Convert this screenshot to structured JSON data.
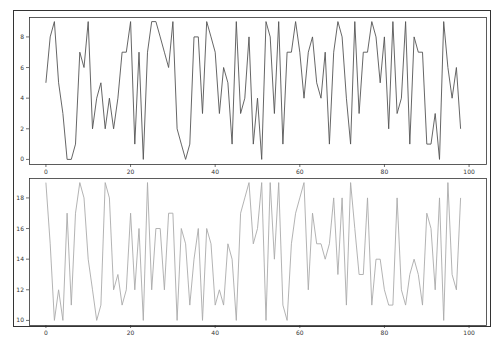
{
  "figure": {
    "outer_frame": {
      "x": 13,
      "y": 10,
      "w": 477,
      "h": 316
    },
    "background": "#ffffff",
    "frame_color": "#333333"
  },
  "chart_data": [
    {
      "type": "line",
      "title": "",
      "xlabel": "",
      "ylabel": "",
      "color": "#555555",
      "xlim": [
        -4,
        104
      ],
      "ylim": [
        -0.3,
        9.3
      ],
      "xticks": [
        0,
        20,
        40,
        60,
        80,
        100
      ],
      "yticks": [
        0,
        2,
        4,
        6,
        8
      ],
      "grid": false,
      "legend": null,
      "x": [
        0,
        1,
        2,
        3,
        4,
        5,
        6,
        7,
        8,
        9,
        10,
        11,
        12,
        13,
        14,
        15,
        16,
        17,
        18,
        19,
        20,
        21,
        22,
        23,
        24,
        25,
        26,
        27,
        28,
        29,
        30,
        31,
        32,
        33,
        34,
        35,
        36,
        37,
        38,
        39,
        40,
        41,
        42,
        43,
        44,
        45,
        46,
        47,
        48,
        49,
        50,
        51,
        52,
        53,
        54,
        55,
        56,
        57,
        58,
        59,
        60,
        61,
        62,
        63,
        64,
        65,
        66,
        67,
        68,
        69,
        70,
        71,
        72,
        73,
        74,
        75,
        76,
        77,
        78,
        79,
        80,
        81,
        82,
        83,
        84,
        85,
        86,
        87,
        88,
        89,
        90,
        91,
        92,
        93,
        94,
        95,
        96,
        97,
        98
      ],
      "values": [
        5,
        8,
        9,
        5,
        3,
        0,
        0,
        1,
        7,
        6,
        9,
        2,
        4,
        5,
        2,
        4,
        2,
        4,
        7,
        7,
        9,
        1,
        7,
        0,
        7,
        9,
        9,
        8,
        7,
        6,
        9,
        2,
        1,
        0,
        1,
        8,
        8,
        3,
        9,
        8,
        7,
        3,
        6,
        5,
        1,
        9,
        3,
        4,
        8,
        1,
        4,
        0,
        9,
        8,
        3,
        9,
        1,
        7,
        7,
        9,
        7,
        4,
        7,
        8,
        5,
        4,
        7,
        1,
        7,
        9,
        8,
        4,
        1,
        9,
        3,
        7,
        7,
        9,
        8,
        5,
        8,
        2,
        9,
        3,
        4,
        9,
        1,
        8,
        7,
        7,
        1,
        1,
        3,
        0,
        9,
        6,
        4,
        6,
        2,
        5,
        7,
        8,
        4,
        4,
        7,
        7,
        4
      ],
      "series": [
        {
          "name": "series_top",
          "note": "99 integer points in range 0-9"
        }
      ]
    },
    {
      "type": "line",
      "title": "",
      "xlabel": "",
      "ylabel": "",
      "color": "#aaaaaa",
      "xlim": [
        -4,
        104
      ],
      "ylim": [
        9.7,
        19.3
      ],
      "xticks": [
        0,
        20,
        40,
        60,
        80,
        100
      ],
      "yticks": [
        10,
        12,
        14,
        16,
        18
      ],
      "grid": false,
      "legend": null,
      "x": [
        0,
        1,
        2,
        3,
        4,
        5,
        6,
        7,
        8,
        9,
        10,
        11,
        12,
        13,
        14,
        15,
        16,
        17,
        18,
        19,
        20,
        21,
        22,
        23,
        24,
        25,
        26,
        27,
        28,
        29,
        30,
        31,
        32,
        33,
        34,
        35,
        36,
        37,
        38,
        39,
        40,
        41,
        42,
        43,
        44,
        45,
        46,
        47,
        48,
        49,
        50,
        51,
        52,
        53,
        54,
        55,
        56,
        57,
        58,
        59,
        60,
        61,
        62,
        63,
        64,
        65,
        66,
        67,
        68,
        69,
        70,
        71,
        72,
        73,
        74,
        75,
        76,
        77,
        78,
        79,
        80,
        81,
        82,
        83,
        84,
        85,
        86,
        87,
        88,
        89,
        90,
        91,
        92,
        93,
        94,
        95,
        96,
        97,
        98
      ],
      "values": [
        19,
        15,
        10,
        12,
        10,
        17,
        11,
        17,
        19,
        18,
        14,
        12,
        10,
        11,
        19,
        18,
        12,
        13,
        11,
        12,
        17,
        12,
        16,
        10,
        19,
        12,
        16,
        16,
        12,
        17,
        17,
        10,
        16,
        15,
        11,
        14,
        16,
        10,
        16,
        15,
        11,
        12,
        11,
        15,
        14,
        10,
        17,
        18,
        19,
        15,
        16,
        19,
        10,
        19,
        14,
        19,
        11,
        10,
        15,
        17,
        18,
        19,
        12,
        17,
        15,
        15,
        14,
        15,
        18,
        13,
        18,
        11,
        19,
        16,
        13,
        13,
        18,
        11,
        14,
        14,
        12,
        11,
        11,
        18,
        12,
        11,
        13,
        14,
        13,
        11,
        17,
        16,
        12,
        18,
        10,
        19,
        13,
        12,
        18,
        11,
        18,
        10,
        16,
        10,
        19,
        12,
        19,
        18,
        11,
        19,
        11
      ]
    }
  ],
  "axes": [
    {
      "name": "top",
      "box": {
        "x": 29,
        "y": 17,
        "w": 457,
        "h": 147
      },
      "xtick_labels": [
        "0",
        "20",
        "40",
        "60",
        "80",
        "100"
      ],
      "ytick_labels": [
        "0",
        "2",
        "4",
        "6",
        "8"
      ]
    },
    {
      "name": "bottom",
      "box": {
        "x": 29,
        "y": 178,
        "w": 457,
        "h": 147
      },
      "xtick_labels": [
        "0",
        "20",
        "40",
        "60",
        "80",
        "100"
      ],
      "ytick_labels": [
        "10",
        "12",
        "14",
        "16",
        "18"
      ]
    }
  ]
}
